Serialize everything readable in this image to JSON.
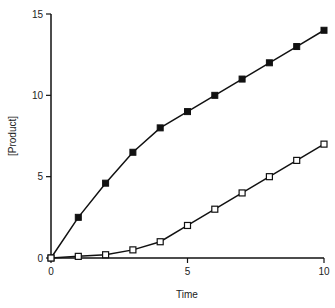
{
  "chart_data": {
    "type": "line",
    "title": "",
    "xlabel": "Time",
    "ylabel": "[Product]",
    "xlim": [
      0,
      10
    ],
    "ylim": [
      0,
      15
    ],
    "grid": false,
    "legend": null,
    "x_ticks": [
      0,
      5,
      10
    ],
    "y_ticks": [
      0,
      5,
      10,
      15
    ],
    "x": [
      0,
      1,
      2,
      3,
      4,
      5,
      6,
      7,
      8,
      9,
      10
    ],
    "series": [
      {
        "name": "filled-squares",
        "marker": "filled-square",
        "values": [
          0,
          2.5,
          4.6,
          6.5,
          8.0,
          9.0,
          10.0,
          11.0,
          12.0,
          13.0,
          14.0
        ]
      },
      {
        "name": "open-squares",
        "marker": "open-square",
        "values": [
          0,
          0.1,
          0.2,
          0.5,
          1.0,
          2.0,
          3.0,
          4.0,
          5.0,
          6.0,
          7.0
        ]
      }
    ]
  },
  "colors": {
    "line": "#111111",
    "background": "#ffffff"
  }
}
